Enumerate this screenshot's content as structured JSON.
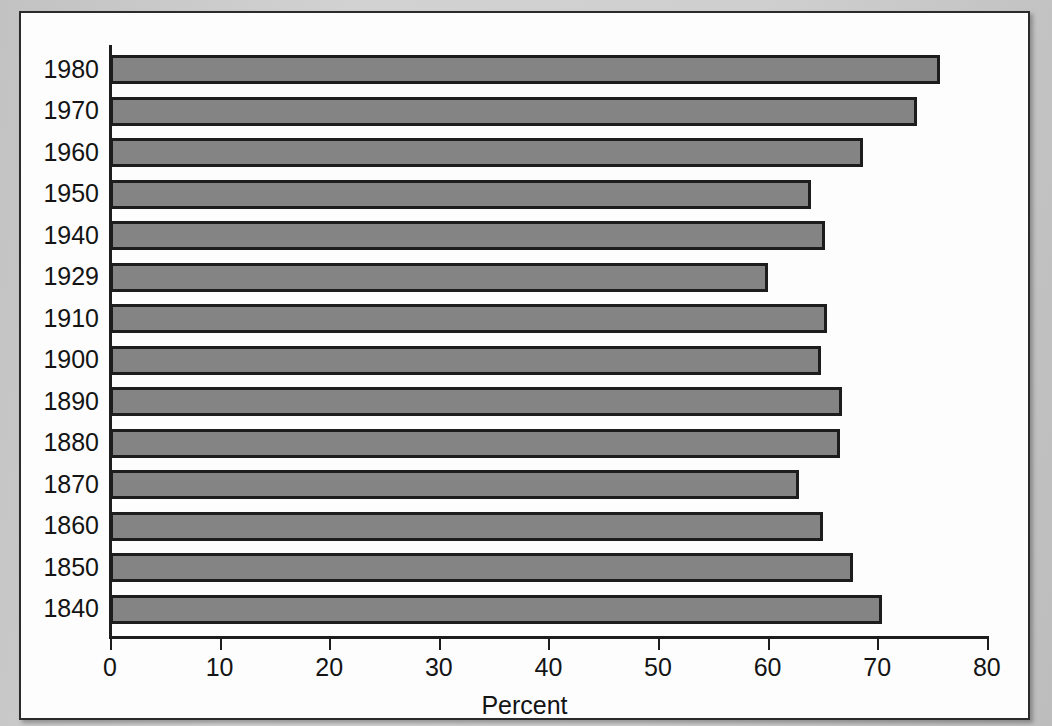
{
  "figure": {
    "caption_fragment": "Figure 5",
    "panel_name": "bar-chart-panel"
  },
  "chart_data": {
    "type": "bar",
    "orientation": "horizontal",
    "title": "",
    "xlabel": "Percent",
    "ylabel": "",
    "xlim": [
      0,
      80
    ],
    "xticks": [
      0,
      10,
      20,
      30,
      40,
      50,
      60,
      70,
      80
    ],
    "xtick_labels": [
      "0",
      "10",
      "20",
      "30",
      "40",
      "50",
      "60",
      "70",
      "80"
    ],
    "grid": false,
    "legend": null,
    "bar_color": "#848484",
    "bar_edge_color": "#1d1d1d",
    "categories": [
      "1980",
      "1970",
      "1960",
      "1950",
      "1940",
      "1929",
      "1910",
      "1900",
      "1890",
      "1880",
      "1870",
      "1860",
      "1850",
      "1840"
    ],
    "values": [
      75.7,
      73.6,
      68.7,
      64.0,
      65.2,
      60.0,
      65.4,
      64.9,
      66.8,
      66.6,
      62.9,
      65.1,
      67.8,
      70.4
    ],
    "bars": [
      {
        "category": "1980",
        "value": 75.7
      },
      {
        "category": "1970",
        "value": 73.6
      },
      {
        "category": "1960",
        "value": 68.7
      },
      {
        "category": "1950",
        "value": 64.0
      },
      {
        "category": "1940",
        "value": 65.2
      },
      {
        "category": "1929",
        "value": 60.0
      },
      {
        "category": "1910",
        "value": 65.4
      },
      {
        "category": "1900",
        "value": 64.9
      },
      {
        "category": "1890",
        "value": 66.8
      },
      {
        "category": "1880",
        "value": 66.6
      },
      {
        "category": "1870",
        "value": 62.9
      },
      {
        "category": "1860",
        "value": 65.1
      },
      {
        "category": "1850",
        "value": 67.8
      },
      {
        "category": "1840",
        "value": 70.4
      }
    ]
  }
}
